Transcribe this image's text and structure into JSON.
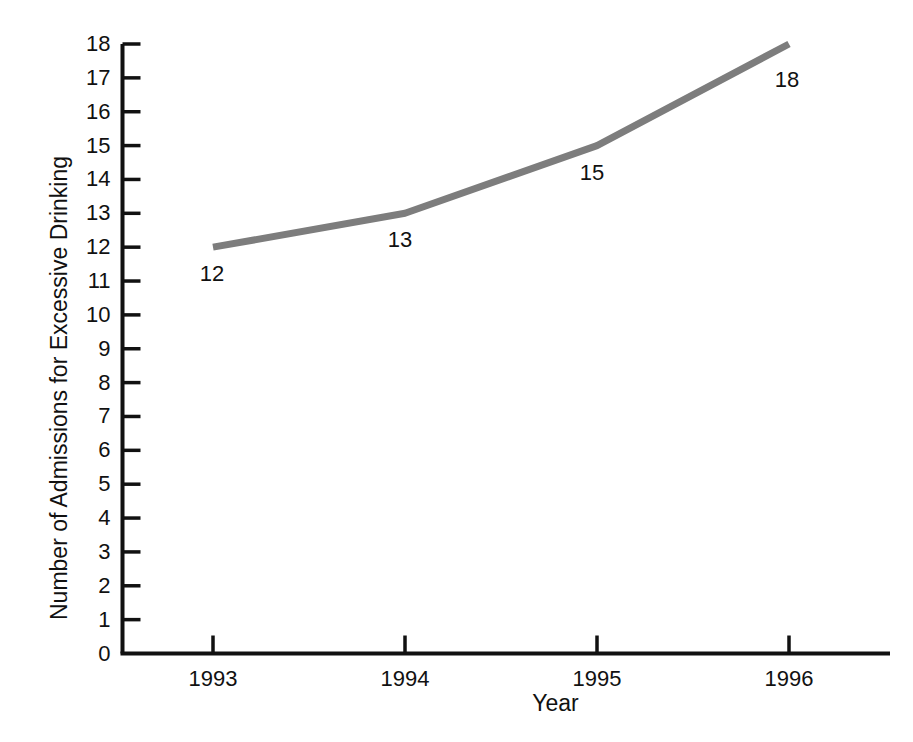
{
  "chart_data": {
    "type": "line",
    "title": "",
    "xlabel": "Year",
    "ylabel": "Number of Admissions for Excessive Drinking",
    "categories": [
      "1993",
      "1994",
      "1995",
      "1996"
    ],
    "x": [
      1993,
      1994,
      1995,
      1996
    ],
    "values": [
      12,
      13,
      15,
      18
    ],
    "point_labels": [
      "12",
      "13",
      "15",
      "18"
    ],
    "series": [
      {
        "name": "Admissions for Excessive Drinking",
        "values": [
          12,
          13,
          15,
          18
        ]
      }
    ],
    "ylim": [
      0,
      18
    ],
    "xlim": [
      1992.53,
      1996.53
    ],
    "y_ticks": [
      0,
      1,
      2,
      3,
      4,
      5,
      6,
      7,
      8,
      9,
      10,
      11,
      12,
      13,
      14,
      15,
      16,
      17,
      18
    ],
    "y_tick_labels": [
      "0",
      "1",
      "2",
      "3",
      "4",
      "5",
      "6",
      "7",
      "8",
      "9",
      "10",
      "11",
      "12",
      "13",
      "14",
      "15",
      "16",
      "17",
      "18"
    ],
    "x_ticks": [
      1993,
      1994,
      1995,
      1996
    ],
    "x_tick_labels": [
      "1993",
      "1994",
      "1995",
      "1996"
    ],
    "grid": false,
    "legend": false,
    "legend_position": "none",
    "line_color": "#7d7d7d",
    "line_width": 7,
    "axis_color": "#111111",
    "background_color": "#ffffff",
    "text_color": "#111111"
  }
}
